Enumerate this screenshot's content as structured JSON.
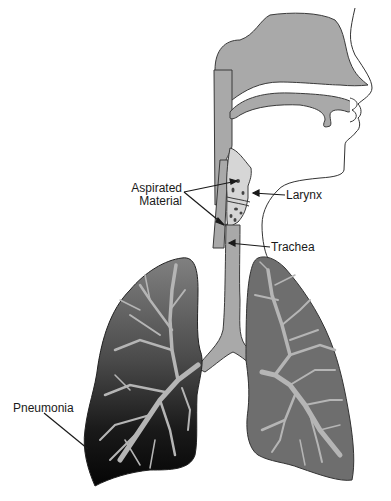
{
  "diagram": {
    "type": "anatomical-illustration",
    "labels": {
      "aspirated_line1": "Aspirated",
      "aspirated_line2": "Material",
      "larynx": "Larynx",
      "trachea": "Trachea",
      "pneumonia": "Pneumonia"
    },
    "colors": {
      "airway_fill": "#a9a9a9",
      "cartilage_fill": "#d6d6d6",
      "right_lung_fill": "#6e6e6e",
      "left_lung_gradient_top": "#7a7a7a",
      "left_lung_gradient_bottom": "#0a0a0a",
      "bronchi_fill": "#b5b5b5",
      "outline": "#3a3a3a",
      "particles": "#444444"
    }
  }
}
